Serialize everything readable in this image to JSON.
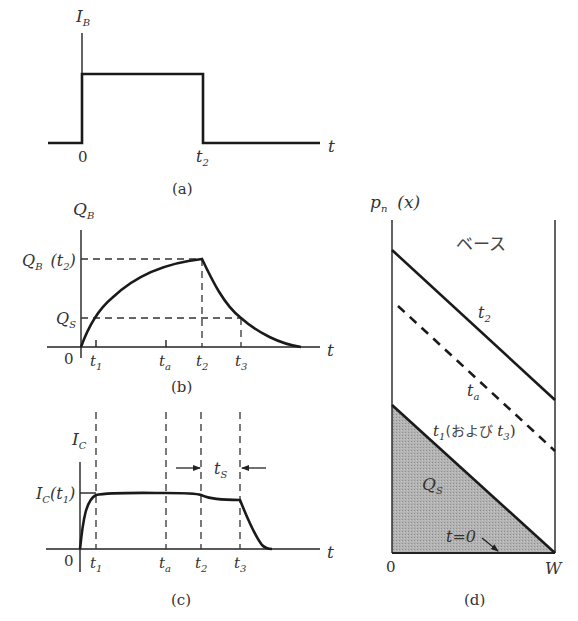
{
  "panel_a": {
    "ylabel": "I",
    "ylabel_sub": "B",
    "xlabel": "t",
    "tick_zero": "0",
    "tick_t2": "t",
    "tick_t2_sub": "2",
    "caption": "(a)"
  },
  "panel_b": {
    "ylabel": "Q",
    "ylabel_sub": "B",
    "level_qb_t2": "Q",
    "level_qb_t2_sub": "B",
    "level_qb_t2_arg": "(t",
    "level_qb_t2_arg_sub": "2",
    "level_qb_t2_close": ")",
    "level_qs": "Q",
    "level_qs_sub": "S",
    "xlabel": "t",
    "tick_zero": "0",
    "ticks": [
      {
        "name": "t",
        "sub": "1"
      },
      {
        "name": "t",
        "sub": "a"
      },
      {
        "name": "t",
        "sub": "2"
      },
      {
        "name": "t",
        "sub": "3"
      }
    ],
    "caption": "(b)"
  },
  "panel_c": {
    "ylabel": "I",
    "ylabel_sub": "C",
    "level_ic_t1": "I",
    "level_ic_t1_sub": "C",
    "level_ic_t1_arg": "(t",
    "level_ic_t1_arg_sub": "1",
    "level_ic_t1_close": ")",
    "storage_label": "t",
    "storage_label_sub": "S",
    "xlabel": "t",
    "tick_zero": "0",
    "ticks": [
      {
        "name": "t",
        "sub": "1"
      },
      {
        "name": "t",
        "sub": "a"
      },
      {
        "name": "t",
        "sub": "2"
      },
      {
        "name": "t",
        "sub": "3"
      }
    ],
    "caption": "(c)"
  },
  "panel_d": {
    "ylabel": "p",
    "ylabel_sub": "n",
    "ylabel_arg": "(x)",
    "region_label": "ベース",
    "line_t2": "t",
    "line_t2_sub": "2",
    "line_ta": "t",
    "line_ta_sub": "a",
    "line_t1": "t",
    "line_t1_sub": "1",
    "line_t1_paren": "(および ",
    "line_t1_t3": "t",
    "line_t1_t3_sub": "3",
    "line_t1_close": ")",
    "shaded_label": "Q",
    "shaded_label_sub": "S",
    "t0_label": "t=0",
    "x_left": "0",
    "x_right": "W",
    "caption": "(d)",
    "fill_color": "#a9a9a9"
  }
}
